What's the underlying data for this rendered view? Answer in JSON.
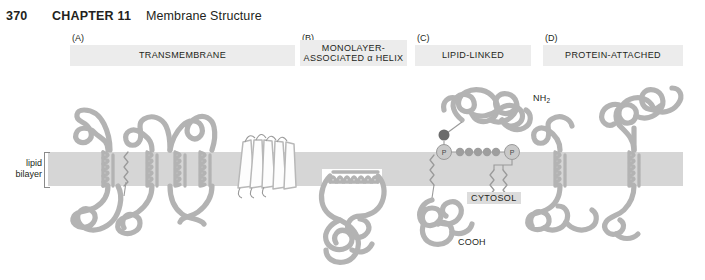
{
  "header": {
    "page_number": "370",
    "chapter": "CHAPTER 11",
    "chapter_title": "Membrane Structure"
  },
  "panels": [
    {
      "letter": "(A)",
      "title": "TRANSMEMBRANE",
      "title_line2": ""
    },
    {
      "letter": "(B)",
      "title": "MONOLAYER-",
      "title_line2": "ASSOCIATED α HELIX"
    },
    {
      "letter": "(C)",
      "title": "LIPID-LINKED",
      "title_line2": ""
    },
    {
      "letter": "(D)",
      "title": "PROTEIN-ATTACHED",
      "title_line2": ""
    }
  ],
  "labels": {
    "bilayer_line1": "lipid",
    "bilayer_line2": "bilayer",
    "cytosol": "CYTOSOL",
    "nh2": "NH",
    "nh2_sub": "2",
    "cooh": "COOH",
    "phosphate_left": "P",
    "phosphate_right": "P"
  },
  "colors": {
    "membrane": "#d6d6d6",
    "protein": "#b3b3b3",
    "band": "#ececec",
    "cytosol_band": "#dcdcdc",
    "text": "#231f20",
    "page_background": "#ffffff"
  }
}
